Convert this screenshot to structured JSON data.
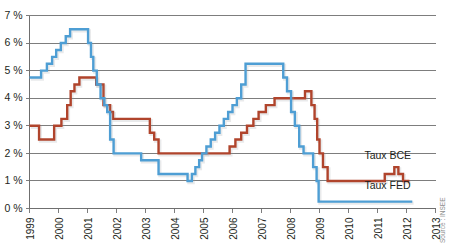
{
  "chart_data": {
    "type": "line",
    "title": "",
    "subtitle": "",
    "xlabel": "",
    "ylabel": "",
    "source": "Source : INSEE",
    "grid": true,
    "legend_position": "inline-right",
    "xlim": [
      1999,
      2013
    ],
    "ylim": [
      0,
      7
    ],
    "y_ticks": [
      0,
      1,
      2,
      3,
      4,
      5,
      6,
      7
    ],
    "y_tick_labels": [
      "0 %",
      "1 %",
      "2 %",
      "3 %",
      "4 %",
      "5 %",
      "6 %",
      "7 %"
    ],
    "x_ticks": [
      1999,
      2000,
      2001,
      2002,
      2003,
      2004,
      2005,
      2006,
      2007,
      2008,
      2009,
      2010,
      2011,
      2012,
      2013
    ],
    "x_tick_labels": [
      "1999",
      "2000",
      "2001",
      "2002",
      "2003",
      "2004",
      "2005",
      "2006",
      "2007",
      "2008",
      "2009",
      "2010",
      "2011",
      "2012",
      "2013"
    ],
    "series": [
      {
        "name": "Taux BCE",
        "color": "#b0442c",
        "label_x": 2010.55,
        "label_y": 1.8,
        "step": "post",
        "x": [
          1999.0,
          1999.33,
          1999.85,
          2000.1,
          2000.3,
          2000.42,
          2000.55,
          2000.72,
          2000.85,
          2001.3,
          2001.55,
          2001.78,
          2001.88,
          2002.95,
          2003.15,
          2003.3,
          2003.45,
          2005.9,
          2006.1,
          2006.3,
          2006.5,
          2006.72,
          2006.9,
          2007.15,
          2007.45,
          2008.5,
          2008.72,
          2008.83,
          2008.92,
          2009.0,
          2009.12,
          2009.28,
          2011.25,
          2011.4,
          2011.58,
          2011.72,
          2011.88,
          2012.1
        ],
        "y": [
          3.0,
          2.5,
          3.0,
          3.25,
          3.75,
          4.25,
          4.5,
          4.75,
          4.75,
          4.5,
          3.75,
          3.5,
          3.25,
          3.25,
          2.75,
          2.5,
          2.0,
          2.25,
          2.5,
          2.75,
          3.0,
          3.25,
          3.5,
          3.75,
          4.0,
          4.25,
          3.75,
          3.25,
          2.5,
          2.0,
          1.5,
          1.0,
          1.25,
          1.25,
          1.5,
          1.25,
          1.0,
          1.0
        ]
      },
      {
        "name": "Taux FED",
        "color": "#4e9ed4",
        "label_x": 2010.55,
        "label_y": 0.72,
        "step": "post",
        "x": [
          1999.0,
          1999.4,
          1999.6,
          1999.78,
          1999.92,
          2000.08,
          2000.25,
          2000.4,
          2000.52,
          2001.02,
          2001.12,
          2001.2,
          2001.32,
          2001.45,
          2001.58,
          2001.68,
          2001.78,
          2001.9,
          2002.85,
          2003.45,
          2004.45,
          2004.6,
          2004.72,
          2004.85,
          2004.95,
          2005.1,
          2005.25,
          2005.4,
          2005.55,
          2005.7,
          2005.85,
          2006.0,
          2006.15,
          2006.3,
          2006.45,
          2007.6,
          2007.75,
          2007.88,
          2008.02,
          2008.15,
          2008.3,
          2008.45,
          2008.78,
          2008.9,
          2008.97,
          2012.2
        ],
        "y": [
          4.75,
          5.0,
          5.25,
          5.5,
          5.75,
          6.0,
          6.25,
          6.5,
          6.5,
          6.0,
          5.5,
          5.0,
          4.5,
          4.0,
          3.75,
          3.5,
          2.5,
          2.0,
          1.75,
          1.25,
          1.0,
          1.25,
          1.5,
          1.75,
          2.0,
          2.25,
          2.5,
          2.75,
          3.0,
          3.25,
          3.5,
          3.75,
          4.0,
          4.5,
          5.25,
          5.25,
          4.75,
          4.25,
          3.5,
          3.0,
          2.25,
          2.0,
          1.5,
          1.0,
          0.25,
          0.25
        ]
      }
    ]
  },
  "axis": {
    "y_unit_suffix": "%"
  }
}
